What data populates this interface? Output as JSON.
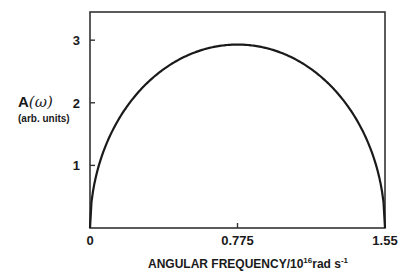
{
  "chart_data": {
    "type": "line",
    "title": "",
    "xlabel": "ANGULAR FREQUENCY/10^16 rad s^-1",
    "ylabel": "A(ω) (arb. units)",
    "xlim": [
      0,
      1.55
    ],
    "ylim": [
      0,
      3.45
    ],
    "x_ticks": [
      0,
      0.775,
      1.55
    ],
    "x_tick_labels": [
      "0",
      "0.775",
      "1.55"
    ],
    "y_ticks": [
      1,
      2,
      3
    ],
    "y_tick_labels": [
      "1",
      "2",
      "3"
    ],
    "grid": false,
    "legend": null,
    "series": [
      {
        "name": "A(ω)",
        "x": [
          0,
          0.05,
          0.1,
          0.2,
          0.3,
          0.4,
          0.5,
          0.6,
          0.7,
          0.775,
          0.85,
          0.95,
          1.05,
          1.15,
          1.25,
          1.35,
          1.45,
          1.5,
          1.55
        ],
        "values": [
          0,
          0.74,
          1.03,
          1.53,
          1.93,
          2.31,
          2.59,
          2.8,
          2.92,
          2.93,
          2.92,
          2.8,
          2.59,
          2.31,
          1.93,
          1.53,
          1.03,
          0.74,
          0
        ]
      }
    ],
    "peak": {
      "x": 0.775,
      "y": 2.93
    }
  },
  "labels": {
    "y_main_prefix": "A",
    "y_main_omega": "(ω)",
    "y_sub": "(arb. units)",
    "x_prefix": "ANGULAR FREQUENCY/10",
    "x_exp": "16",
    "x_unit": "rad s",
    "x_unit_exp": "-1"
  }
}
